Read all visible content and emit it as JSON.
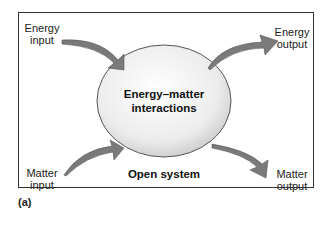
{
  "diagram": {
    "title": "Open system",
    "center_label_line1": "Energy–matter",
    "center_label_line2": "interactions",
    "inputs": {
      "energy": {
        "line1": "Energy",
        "line2": "input"
      },
      "matter": {
        "line1": "Matter",
        "line2": "input"
      }
    },
    "outputs": {
      "energy": {
        "line1": "Energy",
        "line2": "output"
      },
      "matter": {
        "line1": "Matter",
        "line2": "output"
      }
    },
    "colors": {
      "arrow": "#7a7a7a",
      "ellipse_fill": "#e8e8e8",
      "frame": "#333333"
    }
  },
  "caption": "(a)"
}
